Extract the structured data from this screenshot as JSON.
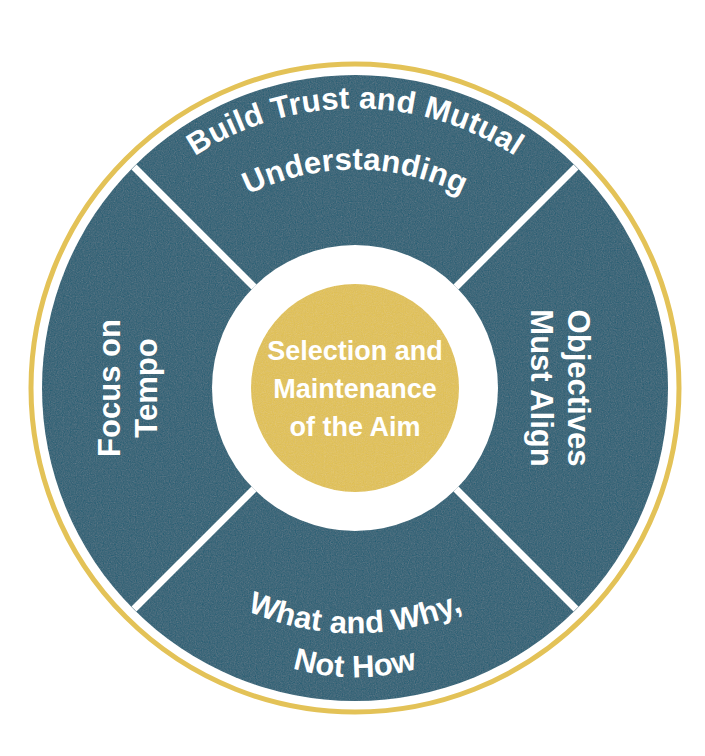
{
  "diagram": {
    "type": "donut-wheel",
    "title": "Selection and Maintenance of the Aim",
    "colors": {
      "segment_fill": "#1f5d73",
      "outer_ring_stroke": "#e3c257",
      "center_circle_fill": "#e3c24f",
      "divider": "#ffffff",
      "text": "#ffffff",
      "background": "#ffffff"
    },
    "center": {
      "line1": "Selection and",
      "line2": "Maintenance",
      "line3": "of the Aim"
    },
    "segments": [
      {
        "position": "top",
        "name": "build-trust",
        "line1": "Build Trust and Mutual",
        "line2": "Understanding"
      },
      {
        "position": "right",
        "name": "objectives-align",
        "line1": "Objectives",
        "line2": "Must Align"
      },
      {
        "position": "bottom",
        "name": "what-and-why",
        "line1": "What and Why,",
        "line2": "Not How"
      },
      {
        "position": "left",
        "name": "focus-on-tempo",
        "line1": "Focus on",
        "line2": "Tempo"
      }
    ]
  }
}
